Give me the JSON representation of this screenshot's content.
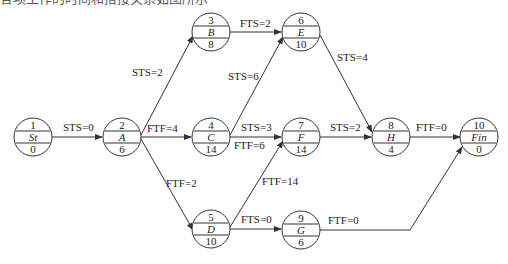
{
  "caption": "各项工作的时间和搭接关系如图所示",
  "nodes": [
    {
      "id": "1",
      "name": "St",
      "duration": "0"
    },
    {
      "id": "2",
      "name": "A",
      "duration": "6"
    },
    {
      "id": "3",
      "name": "B",
      "duration": "8"
    },
    {
      "id": "4",
      "name": "C",
      "duration": "14"
    },
    {
      "id": "5",
      "name": "D",
      "duration": "10"
    },
    {
      "id": "6",
      "name": "E",
      "duration": "10"
    },
    {
      "id": "7",
      "name": "F",
      "duration": "14"
    },
    {
      "id": "8",
      "name": "H",
      "duration": "4"
    },
    {
      "id": "9",
      "name": "G",
      "duration": "6"
    },
    {
      "id": "10",
      "name": "Fin",
      "duration": "0"
    }
  ],
  "edges": [
    {
      "from": "1",
      "to": "2",
      "label": "STS=0"
    },
    {
      "from": "2",
      "to": "3",
      "label": "STS=2"
    },
    {
      "from": "2",
      "to": "4",
      "label": "FTF=4"
    },
    {
      "from": "2",
      "to": "5",
      "label": "FTF=2"
    },
    {
      "from": "3",
      "to": "6",
      "label": "FTS=2"
    },
    {
      "from": "4",
      "to": "6",
      "label": "STS=6"
    },
    {
      "from": "4",
      "to": "7",
      "label": "STS=3"
    },
    {
      "from": "4",
      "to": "7",
      "label": "FTF=6"
    },
    {
      "from": "5",
      "to": "7",
      "label": "FTF=14"
    },
    {
      "from": "5",
      "to": "9",
      "label": "FTS=0"
    },
    {
      "from": "6",
      "to": "8",
      "label": "STS=4"
    },
    {
      "from": "7",
      "to": "8",
      "label": "STS=2"
    },
    {
      "from": "8",
      "to": "10",
      "label": "FTF=0"
    },
    {
      "from": "9",
      "to": "10",
      "label": "FTF=0"
    }
  ]
}
